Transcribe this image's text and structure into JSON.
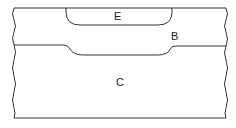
{
  "diagram": {
    "type": "cross-section",
    "line_color": "#333333",
    "background": "#ffffff",
    "regions": [
      {
        "id": "E",
        "label": "E",
        "description": "top pocket region recessed into B"
      },
      {
        "id": "B",
        "label": "B",
        "description": "upper layer"
      },
      {
        "id": "C",
        "label": "C",
        "description": "lower substrate layer"
      }
    ]
  }
}
